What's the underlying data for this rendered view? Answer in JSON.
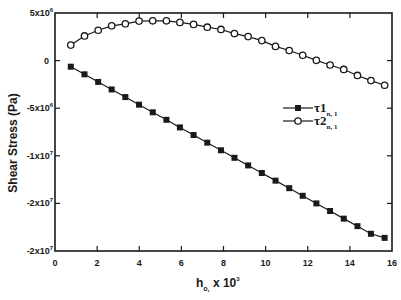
{
  "chart_data": {
    "type": "line",
    "title": "",
    "xlabel": "h_o, x 10^3",
    "xlabel_parts": {
      "main": "h",
      "sub": "o,",
      "rest": " x 10",
      "sup": "3"
    },
    "ylabel": "Shear Stress (Pa)",
    "xlim": [
      0,
      16
    ],
    "ylim": [
      -20000000,
      5000000
    ],
    "x_ticks": [
      0,
      2,
      4,
      6,
      8,
      10,
      12,
      14,
      16
    ],
    "x_tick_labels": [
      "0",
      "2",
      "4",
      "6",
      "8",
      "10",
      "12",
      "14",
      "16"
    ],
    "y_ticks": [
      5000000,
      0,
      -5000000,
      -10000000,
      -15000000,
      -20000000
    ],
    "y_tick_labels": [
      {
        "base": "5x10",
        "exp": "6"
      },
      {
        "base": "0",
        "exp": ""
      },
      {
        "base": "-5x10",
        "exp": "6"
      },
      {
        "base": "-1x10",
        "exp": "7"
      },
      {
        "base": "-2x10",
        "exp": "7"
      },
      {
        "base": "-2x10",
        "exp": "7"
      }
    ],
    "grid": false,
    "legend_position": "inside-right-middle",
    "x": [
      0.75,
      1.4,
      2.05,
      2.69,
      3.34,
      3.99,
      4.64,
      5.29,
      5.93,
      6.58,
      7.23,
      7.88,
      8.52,
      9.17,
      9.82,
      10.47,
      11.12,
      11.76,
      12.41,
      13.06,
      13.71,
      14.36,
      15.0,
      15.65
    ],
    "series": [
      {
        "name": "τ1_{n,1}",
        "legend_main": "τ1",
        "legend_sub": "n, 1",
        "marker": "filled-square",
        "values": [
          -640000,
          -1440000,
          -2240000,
          -3030000,
          -3830000,
          -4630000,
          -5430000,
          -6220000,
          -7020000,
          -7820000,
          -8620000,
          -9420000,
          -10210000,
          -11010000,
          -11810000,
          -12610000,
          -13400000,
          -14200000,
          -15000000,
          -15800000,
          -16600000,
          -17390000,
          -18190000,
          -18620000
        ]
      },
      {
        "name": "τ2_{n,1}",
        "legend_main": "τ2",
        "legend_sub": "n, 1",
        "marker": "open-circle",
        "values": [
          1630000,
          2590000,
          3190000,
          3650000,
          3860000,
          4150000,
          4180000,
          4180000,
          4010000,
          3800000,
          3510000,
          3270000,
          2840000,
          2520000,
          2100000,
          1490000,
          1060000,
          560000,
          30000,
          -460000,
          -930000,
          -1560000,
          -2100000,
          -2590000
        ]
      }
    ]
  },
  "colors": {
    "ink": "#1a1a1a",
    "background": "#ffffff"
  }
}
